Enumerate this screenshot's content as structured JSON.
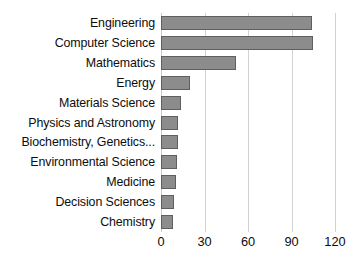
{
  "chart_data": {
    "type": "bar",
    "orientation": "horizontal",
    "title": "",
    "subtitle": "",
    "xlabel": "",
    "ylabel": "",
    "categories": [
      "Engineering",
      "Computer Science",
      "Mathematics",
      "Energy",
      "Materials Science",
      "Physics and Astronomy",
      "Biochemistry, Genetics...",
      "Environmental Science",
      "Medicine",
      "Decision Sciences",
      "Chemistry"
    ],
    "values": [
      104,
      105,
      52,
      20,
      14,
      12,
      11.5,
      11,
      10,
      9,
      8.5
    ],
    "xlim": [
      0,
      120
    ],
    "xticks": [
      0,
      30,
      60,
      90,
      120
    ],
    "xtick_labels": [
      "0",
      "30",
      "60",
      "90",
      "120"
    ],
    "grid": "vertical",
    "legend": "none",
    "bar_color": "#8c8c8c",
    "bar_border_color": "#5f5f5f",
    "gridline_color": "#d2d2d2",
    "background_color": "#ffffff",
    "text_color": "#0d0d0d"
  }
}
